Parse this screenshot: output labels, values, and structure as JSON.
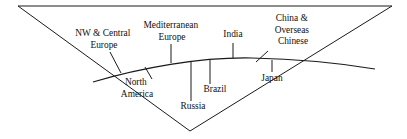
{
  "diagram": {
    "type": "annotated-curve-diagram",
    "shape": "inverted-triangle-wedge",
    "background_color": "#ffffff",
    "line_color": "#1a1a1a",
    "text_color": "#111111",
    "frame": {
      "name": "inverted-triangle",
      "top_left": [
        18,
        6
      ],
      "top_right": [
        392,
        6
      ],
      "apex_bottom": [
        190,
        131
      ]
    },
    "curve": {
      "name": "arc-spectrum",
      "start": [
        93,
        82
      ],
      "peak": [
        250,
        58
      ],
      "end": [
        375,
        69
      ]
    },
    "labels": [
      {
        "id": "nw-central-europe",
        "lines": [
          "NW & Central",
          "Europe"
        ],
        "text_x": 104,
        "text_y": 36,
        "connector": {
          "kind": "leader",
          "x1": 110,
          "y1": 52,
          "x2": 121,
          "y2": 73
        }
      },
      {
        "id": "mediterranean-europe",
        "lines": [
          "Mediterranean",
          "Europe"
        ],
        "text_x": 172,
        "text_y": 28,
        "connector": {
          "kind": "tick",
          "x1": 171,
          "y1": 44,
          "x2": 171,
          "y2": 63
        }
      },
      {
        "id": "india",
        "lines": [
          "India"
        ],
        "text_x": 233,
        "text_y": 37,
        "connector": {
          "kind": "tick",
          "x1": 233,
          "y1": 43,
          "x2": 233,
          "y2": 58
        }
      },
      {
        "id": "china-overseas-chinese",
        "lines": [
          "China &",
          "Overseas",
          "Chinese"
        ],
        "text_x": 293,
        "text_y": 21,
        "connector": {
          "kind": "leader",
          "x1": 268,
          "y1": 51,
          "x2": 256,
          "y2": 62
        }
      },
      {
        "id": "north-america",
        "lines": [
          "North",
          "America"
        ],
        "text_x": 137,
        "text_y": 85,
        "connector": {
          "kind": "leader",
          "x1": 145,
          "y1": 67,
          "x2": 152,
          "y2": 79
        }
      },
      {
        "id": "russia",
        "lines": [
          "Russia"
        ],
        "text_x": 193,
        "text_y": 109,
        "connector": {
          "kind": "tick",
          "x1": 191,
          "y1": 61,
          "x2": 191,
          "y2": 101
        }
      },
      {
        "id": "brazil",
        "lines": [
          "Brazil"
        ],
        "text_x": 215,
        "text_y": 92,
        "connector": {
          "kind": "tick",
          "x1": 210,
          "y1": 60,
          "x2": 210,
          "y2": 84
        }
      },
      {
        "id": "japan",
        "lines": [
          "Japan"
        ],
        "text_x": 272,
        "text_y": 81,
        "connector": {
          "kind": "tick",
          "x1": 272,
          "y1": 60,
          "x2": 272,
          "y2": 72
        }
      }
    ]
  }
}
